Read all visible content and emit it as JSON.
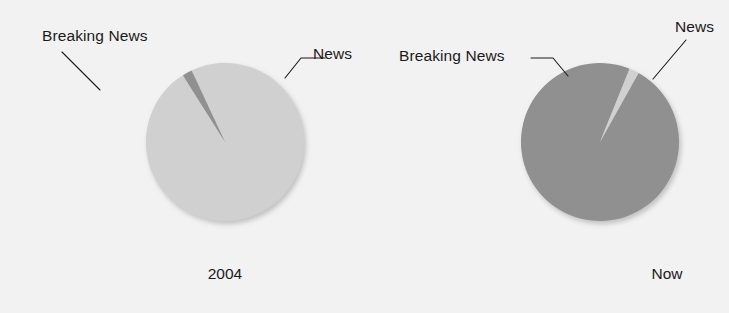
{
  "figure": {
    "background_color": "#f2f2f2",
    "text_color": "#1a1a1a"
  },
  "colors": {
    "news_light_gray": "#d0d0d0",
    "breaking_news_dark_gray": "#909090",
    "shadow": "#c9c9c9"
  },
  "panels": [
    {
      "id": "2004",
      "caption": "2004",
      "labels": {
        "breaking_news": "Breaking News",
        "news": "News"
      }
    },
    {
      "id": "now",
      "caption": "Now",
      "labels": {
        "breaking_news": "Breaking News",
        "news": "News"
      }
    }
  ],
  "chart_data": [
    {
      "type": "pie",
      "title": "2004",
      "labels": [
        "News",
        "Breaking News"
      ],
      "values": [
        98,
        2
      ],
      "units": "percent",
      "colors": [
        "#d0d0d0",
        "#909090"
      ],
      "start_angle_deg": -115,
      "direction": "clockwise",
      "legend": "callout-labels",
      "annotations": [
        {
          "text": "Breaking News",
          "points_to": "Breaking News"
        },
        {
          "text": "News",
          "points_to": "News"
        }
      ]
    },
    {
      "type": "pie",
      "title": "Now",
      "labels": [
        "News",
        "Breaking News"
      ],
      "values": [
        2,
        98
      ],
      "units": "percent",
      "colors": [
        "#d0d0d0",
        "#909090"
      ],
      "start_angle_deg": -68,
      "direction": "clockwise",
      "legend": "callout-labels",
      "annotations": [
        {
          "text": "Breaking News",
          "points_to": "Breaking News"
        },
        {
          "text": "News",
          "points_to": "News"
        }
      ]
    }
  ]
}
